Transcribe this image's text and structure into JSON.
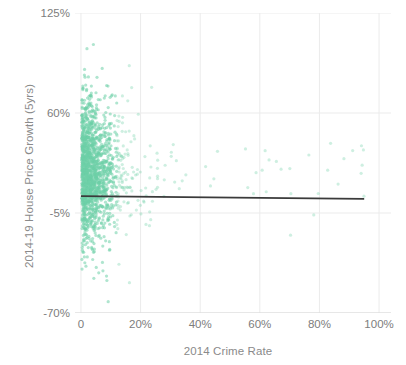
{
  "chart_data": {
    "type": "scatter",
    "title": "",
    "xlabel": "2014 Crime Rate",
    "ylabel": "2014-19 House Price Growth (5yrs)",
    "xlim": [
      -2,
      104
    ],
    "ylim": [
      -70,
      125
    ],
    "xticks": [
      0,
      20,
      40,
      60,
      80,
      100
    ],
    "xticklabels": [
      "0",
      "20%",
      "40%",
      "60%",
      "80%",
      "100%"
    ],
    "yticks": [
      125,
      60,
      -5,
      -70
    ],
    "yticklabels": [
      "125%",
      "60%",
      "-5%",
      "-70%"
    ],
    "grid": true,
    "legend": "none",
    "point_color": "#6ecfa8",
    "point_opacity": 0.55,
    "point_radius": 1.6,
    "trendline": {
      "name": "linear fit",
      "color": "#3a3a3a",
      "x": [
        0,
        95
      ],
      "y": [
        6.0,
        4.2
      ]
    },
    "series": [
      {
        "name": "Local areas",
        "color": "#6ecfa8",
        "n_points": 1600,
        "description": "Dense cluster at low crime rates (0-15%) with house price growth from about -25% to +105%; sparse outliers extending to 95% crime rate.",
        "cluster": {
          "x_mode": 4.0,
          "x_scale": 5.5,
          "x_max": 95,
          "y_mean": 22.0,
          "y_sd": 22.0,
          "y_min": -68,
          "y_max": 112
        }
      }
    ]
  },
  "axes": {
    "y_title": "2014-19 House Price Growth (5yrs)",
    "x_title": "2014 Crime Rate",
    "y_ticks": [
      "125%",
      "60%",
      "-5%",
      "-70%"
    ],
    "x_ticks": [
      "0",
      "20%",
      "40%",
      "60%",
      "80%",
      "100%"
    ]
  },
  "colors": {
    "point": "#6ecfa8",
    "trendline": "#3a3a3a",
    "tick_text": "#7d7d7d",
    "axis_title": "#8a8a8a",
    "grid": "#ebebeb",
    "axis_line": "#d8d8d8",
    "background": "#ffffff"
  }
}
